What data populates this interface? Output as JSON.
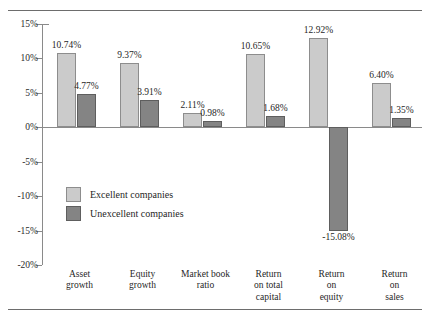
{
  "figure": {
    "title": "",
    "colors": {
      "series_light": "#cbcbcb",
      "series_dark": "#848484",
      "axis": "#8a8a8a",
      "rule": "#6d6d6d"
    }
  },
  "legend": {
    "position": "inside-left",
    "entries": [
      {
        "label": "Excellent companies",
        "swatch": "light"
      },
      {
        "label": "Unexcellent companies",
        "swatch": "dark"
      }
    ]
  },
  "chart_data": {
    "type": "bar",
    "title": "",
    "xlabel": "",
    "ylabel": "",
    "ylim": [
      -20,
      15
    ],
    "ytick_labels": [
      "15%",
      "10%",
      "5%",
      "0%",
      "-5%",
      "-10%",
      "-15%",
      "-20%"
    ],
    "ytick_values": [
      15,
      10,
      5,
      0,
      -5,
      -10,
      -15,
      -20
    ],
    "grid": false,
    "legend_position": "inside-left",
    "categories": [
      "Asset growth",
      "Equity growth",
      "Market book ratio",
      "Return on total capital",
      "Return on equity",
      "Return on sales"
    ],
    "category_lines": [
      [
        "Asset",
        "growth"
      ],
      [
        "Equity",
        "growth"
      ],
      [
        "Market book",
        "ratio"
      ],
      [
        "Return",
        "on total",
        "capital"
      ],
      [
        "Return",
        "on",
        "equity"
      ],
      [
        "Return",
        "on",
        "sales"
      ]
    ],
    "series": [
      {
        "name": "Excellent companies",
        "values": [
          10.74,
          9.37,
          2.11,
          10.65,
          12.92,
          6.4
        ],
        "labels": [
          "10.74%",
          "9.37%",
          "2.11%",
          "10.65%",
          "12.92%",
          "6.40%"
        ]
      },
      {
        "name": "Unexcellent companies",
        "values": [
          4.77,
          3.91,
          0.98,
          1.68,
          -15.08,
          1.35
        ],
        "labels": [
          "4.77%",
          "3.91%",
          "0.98%",
          "1.68%",
          "-15.08%",
          "1.35%"
        ]
      }
    ]
  }
}
